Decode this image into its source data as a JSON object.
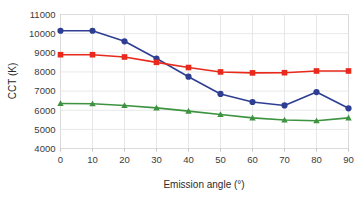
{
  "chart_data": {
    "type": "line",
    "title": "",
    "xlabel": "Emission angle (°)",
    "ylabel": "CCT (K)",
    "x": [
      0,
      10,
      20,
      30,
      40,
      50,
      60,
      70,
      80,
      90
    ],
    "xlim": [
      0,
      90
    ],
    "ylim": [
      4000,
      11000
    ],
    "xticks": [
      "0",
      "10",
      "20",
      "30",
      "40",
      "50",
      "60",
      "70",
      "80",
      "90"
    ],
    "yticks": [
      "4000",
      "5000",
      "6000",
      "7000",
      "8000",
      "9000",
      "10000",
      "11000"
    ],
    "grid": true,
    "legend": "none",
    "series": [
      {
        "name": "blue-series",
        "color": "#2e3f93",
        "marker": "circle",
        "values": [
          10150,
          10150,
          9600,
          8700,
          7750,
          6850,
          6430,
          6250,
          6950,
          6100
        ]
      },
      {
        "name": "red-series",
        "color": "#e8291c",
        "marker": "square",
        "values": [
          8900,
          8900,
          8780,
          8500,
          8230,
          8000,
          7950,
          7960,
          8050,
          8050
        ]
      },
      {
        "name": "green-series",
        "color": "#3d9340",
        "marker": "triangle",
        "values": [
          6350,
          6340,
          6250,
          6120,
          5950,
          5780,
          5600,
          5490,
          5450,
          5600
        ]
      }
    ]
  }
}
